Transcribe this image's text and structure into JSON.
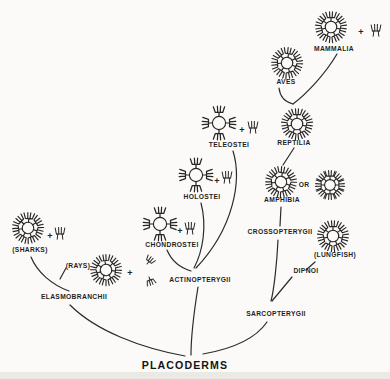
{
  "figure": {
    "type": "phylogenetic-tree"
  },
  "colors": {
    "background": "#fbfaf8",
    "ink": "#262626"
  },
  "plus_sign": "+",
  "nodes": {
    "placoderms": {
      "label": "PLACODERMS"
    },
    "elasmobranchii": {
      "label": "ELASMOBRANCHII"
    },
    "sharks": {
      "label": "(SHARKS)",
      "glyph": "ring-polymer",
      "extra": "plus-monomer"
    },
    "rays": {
      "label": "(RAYS)",
      "glyph": "ring-polymer",
      "extra": "plus-aggregate"
    },
    "actinopterygii": {
      "label": "ACTINOPTERYGII"
    },
    "chondrostei": {
      "label": "CHONDROSTEI",
      "glyph": "tetramer-cross",
      "extra": "plus-monomer"
    },
    "holostei": {
      "label": "HOLOSTEI",
      "glyph": "tetramer-cross",
      "extra": "plus-monomer"
    },
    "teleostei": {
      "label": "TELEOSTEI",
      "glyph": "tetramer-cross",
      "extra": "plus-monomer"
    },
    "sarcopterygii": {
      "label": "SARCOPTERYGII"
    },
    "crossopterygii": {
      "label": "CROSSOPTERYGII"
    },
    "dipnoi": {
      "label": "DIPNOI",
      "paren_label": "(LUNGFISH)",
      "glyph": "ring-polymer"
    },
    "amphibia": {
      "label": "AMPHIBIA",
      "or_label": "OR",
      "glyph": "ring-polymer",
      "alt_glyph": "ring-polymer-8"
    },
    "reptilia": {
      "label": "REPTILIA",
      "glyph": "ring-polymer"
    },
    "aves": {
      "label": "AVES",
      "glyph": "ring-polymer"
    },
    "mammalia": {
      "label": "MAMMALIA",
      "glyph": "ring-polymer",
      "extra": "plus-monomer"
    }
  },
  "edges": [
    [
      "PLACODERMS",
      "ELASMOBRANCHII"
    ],
    [
      "PLACODERMS",
      "ACTINOPTERYGII"
    ],
    [
      "PLACODERMS",
      "SARCOPTERYGII"
    ],
    [
      "ELASMOBRANCHII",
      "(SHARKS)"
    ],
    [
      "ELASMOBRANCHII",
      "(RAYS)"
    ],
    [
      "ACTINOPTERYGII",
      "CHONDROSTEI"
    ],
    [
      "ACTINOPTERYGII",
      "HOLOSTEI"
    ],
    [
      "ACTINOPTERYGII",
      "TELEOSTEI"
    ],
    [
      "SARCOPTERYGII",
      "CROSSOPTERYGII"
    ],
    [
      "SARCOPTERYGII",
      "DIPNOI"
    ],
    [
      "DIPNOI",
      "(LUNGFISH)"
    ],
    [
      "CROSSOPTERYGII",
      "AMPHIBIA"
    ],
    [
      "AMPHIBIA",
      "REPTILIA"
    ],
    [
      "REPTILIA",
      "AVES"
    ],
    [
      "REPTILIA",
      "MAMMALIA"
    ]
  ]
}
